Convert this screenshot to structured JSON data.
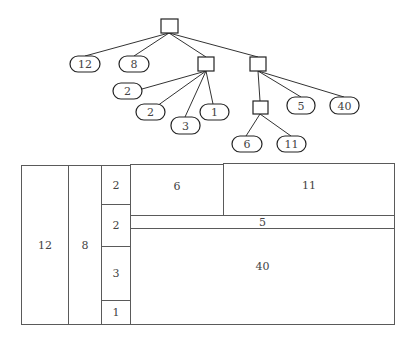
{
  "diagram": {
    "type": "tree-and-treemap",
    "tree": {
      "root": {
        "id": "root",
        "children": [
          {
            "id": "leaf-12",
            "value": "12"
          },
          {
            "id": "leaf-8",
            "value": "8"
          },
          {
            "id": "group-a",
            "children": [
              {
                "id": "leaf-2a",
                "value": "2"
              },
              {
                "id": "leaf-2b",
                "value": "2"
              },
              {
                "id": "leaf-3",
                "value": "3"
              },
              {
                "id": "leaf-1",
                "value": "1"
              }
            ]
          },
          {
            "id": "group-b",
            "children": [
              {
                "id": "group-c",
                "children": [
                  {
                    "id": "leaf-6",
                    "value": "6"
                  },
                  {
                    "id": "leaf-11",
                    "value": "11"
                  }
                ]
              },
              {
                "id": "leaf-5",
                "value": "5"
              },
              {
                "id": "leaf-40",
                "value": "40"
              }
            ]
          }
        ]
      }
    },
    "treemap": {
      "cells": [
        {
          "label": "12"
        },
        {
          "label": "8"
        },
        {
          "label": "2"
        },
        {
          "label": "2"
        },
        {
          "label": "3"
        },
        {
          "label": "1"
        },
        {
          "label": "6"
        },
        {
          "label": "11"
        },
        {
          "label": "5"
        },
        {
          "label": "40"
        }
      ]
    }
  },
  "leaves": {
    "v12": "12",
    "v8": "8",
    "v2a": "2",
    "v2b": "2",
    "v3": "3",
    "v1": "1",
    "v6": "6",
    "v11": "11",
    "v5": "5",
    "v40": "40"
  }
}
